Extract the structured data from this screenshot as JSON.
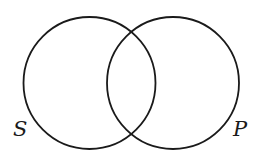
{
  "diagram": {
    "type": "venn",
    "stroke_color": "#1a1a1a",
    "background": "#ffffff",
    "sets": [
      {
        "id": "S",
        "label": "S",
        "cx": 89.5,
        "cy": 83,
        "r": 66
      },
      {
        "id": "P",
        "label": "P",
        "cx": 173,
        "cy": 83,
        "r": 66
      }
    ]
  }
}
